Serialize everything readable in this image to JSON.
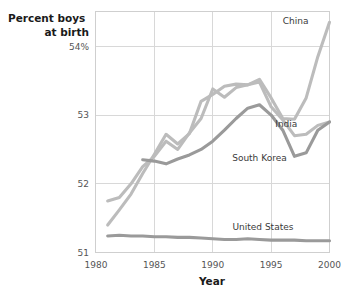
{
  "chart_data": {
    "type": "line",
    "title": "",
    "xlabel": "Year",
    "ylabel": "Percent boys at birth",
    "ylabel_line1": "Percent boys",
    "ylabel_line2": "at birth",
    "xlim": [
      1980,
      2000
    ],
    "ylim": [
      51,
      54.5
    ],
    "grid": true,
    "legend_position": "inline-right",
    "xticks": [
      1980,
      1985,
      1990,
      1995,
      2000
    ],
    "xtick_labels": [
      "1980",
      "1985",
      "1990",
      "1995",
      "2000"
    ],
    "yticks": [
      51,
      52,
      53,
      54
    ],
    "ytick_labels": [
      "51",
      "52",
      "53",
      "54%"
    ],
    "colors": {
      "china": "#bcbcbc",
      "india": "#bcbcbc",
      "south_korea": "#9a9a9a",
      "united_states": "#9a9a9a",
      "gridline": "#d8d8d8",
      "frame": "#cfcfcf",
      "text": "#3a3a3a",
      "tick_text": "#555555"
    },
    "series": [
      {
        "name": "China",
        "label": "China",
        "color": "#bcbcbc",
        "x": [
          1981,
          1982,
          1983,
          1984,
          1985,
          1986,
          1987,
          1988,
          1989,
          1990,
          1991,
          1992,
          1993,
          1994,
          1995,
          1996,
          1997,
          1998,
          1999,
          2000
        ],
        "values": [
          51.4,
          51.62,
          51.85,
          52.15,
          52.43,
          52.72,
          52.58,
          52.73,
          53.2,
          53.3,
          53.42,
          53.45,
          53.44,
          53.52,
          53.25,
          52.95,
          52.94,
          53.25,
          53.85,
          54.35
        ]
      },
      {
        "name": "India",
        "label": "India",
        "color": "#bcbcbc",
        "x": [
          1981,
          1982,
          1983,
          1984,
          1985,
          1986,
          1987,
          1988,
          1989,
          1990,
          1991,
          1992,
          1993,
          1994,
          1995,
          1996,
          1997,
          1998,
          1999,
          2000
        ],
        "values": [
          51.75,
          51.8,
          52.0,
          52.25,
          52.4,
          52.62,
          52.5,
          52.74,
          52.95,
          53.38,
          53.26,
          53.4,
          53.44,
          53.48,
          53.12,
          52.93,
          52.7,
          52.72,
          52.85,
          52.9
        ]
      },
      {
        "name": "South Korea",
        "label": "South Korea",
        "color": "#9a9a9a",
        "x": [
          1984,
          1985,
          1986,
          1987,
          1988,
          1989,
          1990,
          1991,
          1992,
          1993,
          1994,
          1995,
          1996,
          1997,
          1998,
          1999,
          2000
        ],
        "values": [
          52.35,
          52.33,
          52.29,
          52.36,
          52.42,
          52.5,
          52.62,
          52.78,
          52.95,
          53.1,
          53.15,
          53.0,
          52.78,
          52.4,
          52.45,
          52.78,
          52.9
        ]
      },
      {
        "name": "United States",
        "label": "United States",
        "color": "#9a9a9a",
        "x": [
          1981,
          1982,
          1983,
          1984,
          1985,
          1986,
          1987,
          1988,
          1989,
          1990,
          1991,
          1992,
          1993,
          1994,
          1995,
          1996,
          1997,
          1998,
          1999,
          2000
        ],
        "values": [
          51.24,
          51.25,
          51.24,
          51.24,
          51.23,
          51.23,
          51.22,
          51.22,
          51.21,
          51.2,
          51.19,
          51.19,
          51.2,
          51.19,
          51.18,
          51.18,
          51.18,
          51.17,
          51.17,
          51.17
        ]
      }
    ],
    "annotations": [
      {
        "name": "China",
        "text": "China",
        "x": 1997.1,
        "y": 54.32
      },
      {
        "name": "India",
        "text": "India",
        "x": 1996.3,
        "y": 52.82
      },
      {
        "name": "South Korea",
        "text": "South Korea",
        "x": 1994.0,
        "y": 52.33
      },
      {
        "name": "United States",
        "text": "United States",
        "x": 1994.3,
        "y": 51.33
      }
    ]
  }
}
